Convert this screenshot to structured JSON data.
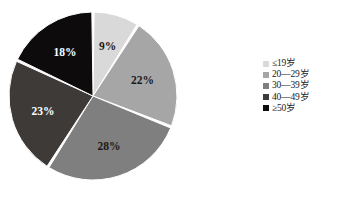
{
  "chart_data": {
    "type": "pie",
    "title": "",
    "subtitle": "",
    "xlabel": "",
    "ylabel": "",
    "grid": false,
    "legend_position": "right",
    "units": "percent",
    "start_angle_deg": 0,
    "direction": "clockwise",
    "categories": [
      "≤19岁",
      "20—29岁",
      "30—39岁",
      "40—49岁",
      "≥50岁"
    ],
    "values": [
      9,
      22,
      28,
      23,
      18
    ],
    "labels": [
      "9%",
      "22%",
      "28%",
      "23%",
      "18%"
    ],
    "colors": [
      "#d9d9d9",
      "#a6a6a6",
      "#7f7f7f",
      "#3d3a38",
      "#0d0b0b"
    ],
    "label_colors": [
      "#1a1a1a",
      "#1a1a1a",
      "#1a1a1a",
      "#ffffff",
      "#ffffff"
    ],
    "slices": [
      {
        "category": "≤19岁",
        "value": 9,
        "label": "9%",
        "color": "#d9d9d9",
        "label_color": "#1a1a1a"
      },
      {
        "category": "20—29岁",
        "value": 22,
        "label": "22%",
        "color": "#a6a6a6",
        "label_color": "#1a1a1a"
      },
      {
        "category": "30—39岁",
        "value": 28,
        "label": "28%",
        "color": "#7f7f7f",
        "label_color": "#1a1a1a"
      },
      {
        "category": "40—49岁",
        "value": 23,
        "label": "23%",
        "color": "#3d3a38",
        "label_color": "#ffffff"
      },
      {
        "category": "≥50岁",
        "value": 18,
        "label": "18%",
        "color": "#0d0b0b",
        "label_color": "#ffffff"
      }
    ]
  },
  "legend": {
    "items": [
      {
        "label": "≤19岁",
        "color": "#d9d9d9"
      },
      {
        "label": "20—29岁",
        "color": "#a6a6a6"
      },
      {
        "label": "30—39岁",
        "color": "#7f7f7f"
      },
      {
        "label": "40—49岁",
        "color": "#3d3a38"
      },
      {
        "label": "≥50岁",
        "color": "#0d0b0b"
      }
    ]
  },
  "geometry": {
    "center_x": 93,
    "center_y": 96,
    "radius": 84,
    "gap_deg": 1.6,
    "label_radius_ratio": 0.62
  },
  "background_color": "#ffffff"
}
